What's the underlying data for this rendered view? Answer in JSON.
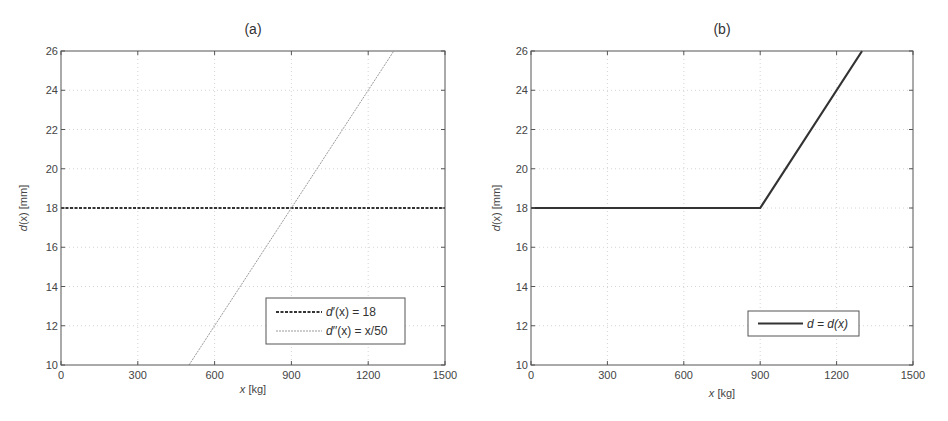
{
  "chart_data": [
    {
      "type": "line",
      "panel": "a",
      "title": "(a)",
      "xlabel": "x [kg]",
      "ylabel": "d(x) [mm]",
      "xlim": [
        0,
        1500
      ],
      "ylim": [
        10,
        26
      ],
      "xticks": [
        0,
        300,
        600,
        900,
        1200,
        1500
      ],
      "yticks": [
        10,
        12,
        14,
        16,
        18,
        20,
        22,
        24,
        26
      ],
      "grid": true,
      "legend_position": "lower right",
      "series": [
        {
          "name": "d'(x) = 18",
          "style": "dashed-thick",
          "color": "#333333",
          "x": [
            0,
            1500
          ],
          "y": [
            18,
            18
          ]
        },
        {
          "name": "d''(x) = x/50",
          "style": "thin-dotted",
          "color": "#9a9a9a",
          "x": [
            500,
            1300
          ],
          "y": [
            10,
            26
          ]
        }
      ]
    },
    {
      "type": "line",
      "panel": "b",
      "title": "(b)",
      "xlabel": "x [kg]",
      "ylabel": "d(x) [mm]",
      "xlim": [
        0,
        1500
      ],
      "ylim": [
        10,
        26
      ],
      "xticks": [
        0,
        300,
        600,
        900,
        1200,
        1500
      ],
      "yticks": [
        10,
        12,
        14,
        16,
        18,
        20,
        22,
        24,
        26
      ],
      "grid": true,
      "legend_position": "lower right",
      "series": [
        {
          "name": "d = d(x)",
          "style": "solid-thick",
          "color": "#333333",
          "x": [
            0,
            900,
            1300
          ],
          "y": [
            18,
            18,
            26
          ]
        }
      ]
    }
  ],
  "panels": {
    "a": {
      "title": "(a)",
      "xlabel_var": "x",
      "xlabel_unit": " [kg]",
      "ylabel_var": "d",
      "ylabel_arg": "(x)",
      "ylabel_unit": " [mm]",
      "legend": [
        {
          "pre": "d",
          "prime": "′",
          "args": "(x) = 18"
        },
        {
          "pre": "d",
          "prime": "′′",
          "args": "(x) = x/50"
        }
      ]
    },
    "b": {
      "title": "(b)",
      "xlabel_var": "x",
      "xlabel_unit": " [kg]",
      "ylabel_var": "d",
      "ylabel_arg": "(x)",
      "ylabel_unit": " [mm]",
      "legend": [
        {
          "text": "d = d(x)"
        }
      ]
    }
  }
}
